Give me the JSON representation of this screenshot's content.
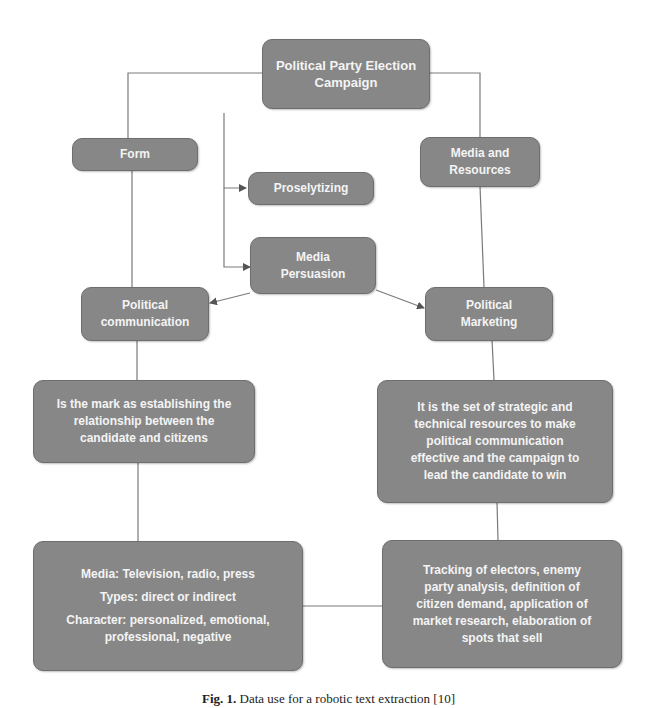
{
  "diagram": {
    "nodes": {
      "root": {
        "lines": [
          "Political Party Election",
          "Campaign"
        ]
      },
      "form": {
        "lines": [
          "Form"
        ]
      },
      "media_resources": {
        "lines": [
          "Media and",
          "Resources"
        ]
      },
      "proselytizing": {
        "lines": [
          "Proselytizing"
        ]
      },
      "media_persuasion": {
        "lines": [
          "Media",
          "Persuasion"
        ]
      },
      "political_communication": {
        "lines": [
          "Political",
          "communication"
        ]
      },
      "political_marketing": {
        "lines": [
          "Political",
          "Marketing"
        ]
      },
      "comm_definition": {
        "lines": [
          "Is the mark as establishing the",
          "relationship between the",
          "candidate and citizens"
        ]
      },
      "marketing_definition": {
        "lines": [
          "It is the set of strategic and",
          "technical resources to make",
          "political communication",
          "effective and the campaign to",
          "lead the candidate to win"
        ]
      },
      "comm_details": {
        "lines": [
          "Media: Television, radio, press",
          "Types: direct or indirect",
          "Character: personalized, emotional,",
          "professional, negative"
        ]
      },
      "marketing_details": {
        "lines": [
          "Tracking of electors, enemy",
          "party analysis, definition of",
          "citizen demand, application of",
          "market research, elaboration of",
          "spots that sell"
        ]
      }
    },
    "colors": {
      "node_fill": "#878787",
      "node_border": "#6e6e6e",
      "node_text": "#f4f4f4",
      "connector": "#7a7a7a"
    }
  },
  "caption": {
    "label": "Fig. 1.",
    "text": "Data use for a robotic text extraction [10]"
  }
}
